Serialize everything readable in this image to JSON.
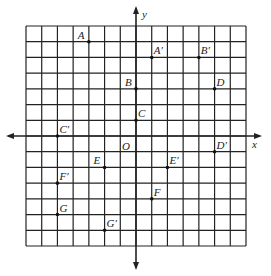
{
  "diagram": {
    "type": "coordinate-grid",
    "axes": {
      "x_label": "x",
      "y_label": "y",
      "origin_label": "O"
    },
    "grid": {
      "xmin": -7,
      "xmax": 7,
      "ymin": -7,
      "ymax": 7
    },
    "points": [
      {
        "name": "A",
        "x": -3,
        "y": 6
      },
      {
        "name": "A′",
        "x": 1,
        "y": 5
      },
      {
        "name": "B",
        "x": 0,
        "y": 3
      },
      {
        "name": "B′",
        "x": 4,
        "y": 5
      },
      {
        "name": "C",
        "x": 0,
        "y": 1
      },
      {
        "name": "C′",
        "x": -5,
        "y": 0
      },
      {
        "name": "D",
        "x": 5,
        "y": 3
      },
      {
        "name": "D′",
        "x": 5,
        "y": -1
      },
      {
        "name": "E",
        "x": -2,
        "y": -2
      },
      {
        "name": "E′",
        "x": 2,
        "y": -2
      },
      {
        "name": "F",
        "x": 1,
        "y": -4
      },
      {
        "name": "F′",
        "x": -5,
        "y": -3
      },
      {
        "name": "G",
        "x": -5,
        "y": -5
      },
      {
        "name": "G′",
        "x": -2,
        "y": -6
      }
    ],
    "colors": {
      "line": "#222222",
      "point": "#111111"
    }
  }
}
